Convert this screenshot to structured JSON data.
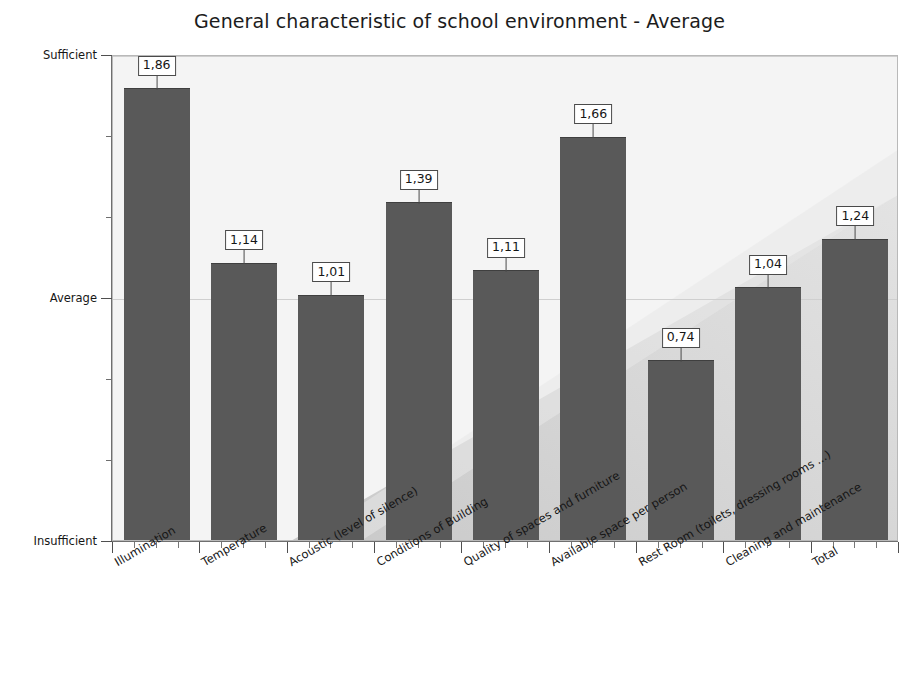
{
  "chart_data": {
    "type": "bar",
    "title": "General characteristic of school environment - Average",
    "xlabel": "",
    "ylabel": "",
    "categories": [
      "Illumination",
      "Temperature",
      "Acoustic (level of silence)",
      "Conditions of Building",
      "Quality of spaces and furniture",
      "Available space per person",
      "Rest Room (toilets, dressing rooms ...)",
      "Cleaning and maintenance",
      "Total"
    ],
    "values": [
      1.86,
      1.14,
      1.01,
      1.39,
      1.11,
      1.66,
      0.74,
      1.04,
      1.24
    ],
    "value_labels": [
      "1,86",
      "1,14",
      "1,01",
      "1,39",
      "1,11",
      "1,66",
      "0,74",
      "1,04",
      "1,24"
    ],
    "ylim": [
      0,
      2
    ],
    "ytick_values": [
      0,
      1,
      2
    ],
    "ytick_labels": [
      "Insufficient",
      "Average",
      "Sufficient"
    ],
    "yminor_ticks_per_interval": 3,
    "grid": true,
    "gridlines_at": [
      1,
      2
    ],
    "legend": null,
    "legend_position": "none",
    "bar_color": "#595959",
    "plot_background": "#f2f2f2",
    "label_box_border": "#4a4a4a",
    "axis_color": "#6f6f6f",
    "gridline_color": "#cfcfcf",
    "title_color": "#1c1c1c",
    "value_decimal_separator": ","
  }
}
